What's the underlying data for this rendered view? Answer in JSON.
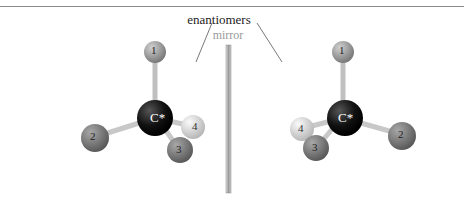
{
  "figure": {
    "title": "enantiomers",
    "mirror_label": "mirror",
    "colors": {
      "carbon": "#111111",
      "substituent_1": "#9a9a9a",
      "substituent_2": "#7a7a7a",
      "substituent_3": "#6e6e6e",
      "substituent_4": "#d8d8d8",
      "bond": "#c8c8c8",
      "mirror": "#b0b0b0",
      "pointer_line": "#555555"
    },
    "left_molecule": {
      "center_label": "C*",
      "atoms": [
        {
          "label": "1"
        },
        {
          "label": "2"
        },
        {
          "label": "3"
        },
        {
          "label": "4"
        }
      ]
    },
    "right_molecule": {
      "center_label": "C*",
      "atoms": [
        {
          "label": "1"
        },
        {
          "label": "2"
        },
        {
          "label": "3"
        },
        {
          "label": "4"
        }
      ]
    }
  }
}
